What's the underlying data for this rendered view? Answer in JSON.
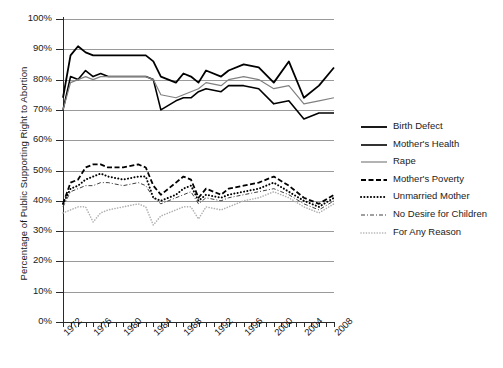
{
  "chart_data": {
    "type": "line",
    "title": "",
    "xlabel": "",
    "ylabel": "Percentage of Public Supporting Right to Abortion",
    "ylim": [
      0,
      100
    ],
    "xlim": [
      1972,
      2008
    ],
    "grid": true,
    "legend_position": "right",
    "ytick_labels": [
      "100%",
      "90%",
      "80%",
      "70%",
      "60%",
      "50%",
      "40%",
      "30%",
      "20%",
      "10%",
      "0%"
    ],
    "ytick_values": [
      100,
      90,
      80,
      70,
      60,
      50,
      40,
      30,
      20,
      10,
      0
    ],
    "xtick_labels": [
      "1972",
      "1976",
      "1980",
      "1984",
      "1988",
      "1992",
      "1996",
      "2000",
      "2004",
      "2008"
    ],
    "xtick_values": [
      1972,
      1976,
      1980,
      1984,
      1988,
      1992,
      1996,
      2000,
      2004,
      2008
    ],
    "x": [
      1972,
      1973,
      1974,
      1975,
      1976,
      1977,
      1978,
      1980,
      1982,
      1983,
      1984,
      1985,
      1987,
      1988,
      1989,
      1990,
      1991,
      1993,
      1994,
      1996,
      1998,
      2000,
      2002,
      2004,
      2006,
      2008
    ],
    "series": [
      {
        "name": "Birth Defect",
        "style": "solid",
        "color": "#000000",
        "width": 1.8,
        "values": [
          74,
          88,
          91,
          89,
          88,
          88,
          88,
          88,
          88,
          88,
          86,
          81,
          79,
          82,
          81,
          79,
          83,
          81,
          83,
          85,
          84,
          79,
          86,
          74,
          78,
          84
        ]
      },
      {
        "name": "Mother's Health",
        "style": "solid",
        "color": "#000000",
        "width": 1.6,
        "values": [
          70,
          81,
          80,
          83,
          81,
          82,
          81,
          81,
          81,
          81,
          80,
          70,
          73,
          74,
          74,
          76,
          77,
          76,
          78,
          78,
          77,
          72,
          73,
          67,
          69,
          69
        ]
      },
      {
        "name": "Rape",
        "style": "solid",
        "color": "#808080",
        "width": 1.2,
        "values": [
          70,
          79,
          80,
          81,
          80,
          81,
          81,
          81,
          81,
          81,
          80,
          75,
          74,
          75,
          76,
          77,
          79,
          78,
          80,
          81,
          80,
          77,
          78,
          72,
          73,
          74
        ]
      },
      {
        "name": "Mother's Poverty",
        "style": "dashed",
        "color": "#000000",
        "width": 1.8,
        "values": [
          39,
          46,
          47,
          51,
          52,
          52,
          51,
          51,
          52,
          51,
          45,
          42,
          46,
          48,
          47,
          41,
          44,
          42,
          44,
          45,
          46,
          48,
          45,
          41,
          39,
          42
        ]
      },
      {
        "name": "Unmarried Mother",
        "style": "dotted",
        "color": "#000000",
        "width": 2.0,
        "values": [
          39,
          44,
          45,
          47,
          48,
          49,
          48,
          47,
          48,
          48,
          41,
          40,
          42,
          44,
          45,
          40,
          42,
          41,
          42,
          43,
          44,
          46,
          43,
          40,
          38,
          41
        ]
      },
      {
        "name": "No Desire for Children",
        "style": "dashdot",
        "color": "#404040",
        "width": 1.0,
        "values": [
          38,
          43,
          44,
          45,
          45,
          46,
          46,
          45,
          46,
          45,
          41,
          39,
          41,
          42,
          43,
          39,
          41,
          40,
          41,
          42,
          43,
          44,
          42,
          39,
          37,
          40
        ]
      },
      {
        "name": "For Any Reason",
        "style": "fine-dotted",
        "color": "#b0b0b0",
        "width": 1.6,
        "values": [
          36,
          37,
          38,
          38,
          33,
          36,
          37,
          38,
          39,
          38,
          32,
          35,
          37,
          38,
          38,
          34,
          38,
          37,
          38,
          40,
          41,
          43,
          41,
          38,
          36,
          39
        ]
      }
    ]
  },
  "legend": {
    "items": [
      {
        "label": "Birth Defect",
        "icon": "solid-line-swatch"
      },
      {
        "label": "Mother's Health",
        "icon": "solid-line-swatch"
      },
      {
        "label": "Rape",
        "icon": "thin-gray-line-swatch"
      },
      {
        "label": "Mother's Poverty",
        "icon": "dashed-line-swatch"
      },
      {
        "label": "Unmarried Mother",
        "icon": "dotted-line-swatch"
      },
      {
        "label": "No Desire for Children",
        "icon": "dash-dot-line-swatch"
      },
      {
        "label": "For Any Reason",
        "icon": "fine-dotted-line-swatch"
      }
    ]
  }
}
